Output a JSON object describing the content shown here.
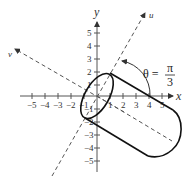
{
  "diagram": {
    "type": "coordinate-rotation-cylinder",
    "axes": {
      "x_label": "x",
      "y_label": "y",
      "u_label": "u",
      "v_label": "v",
      "x_ticks": [
        "−5",
        "−4",
        "−3",
        "−2",
        "−1",
        "1",
        "2",
        "3",
        "4",
        "5"
      ],
      "y_ticks": [
        "5",
        "4",
        "3",
        "2",
        "1",
        "−1",
        "−2",
        "−3",
        "−4",
        "−5"
      ]
    },
    "angle": {
      "theta_symbol": "θ =",
      "numerator": "π",
      "denominator": "3"
    },
    "colors": {
      "axis": "#555555",
      "curve": "#111111",
      "dashed": "#555555",
      "text": "#333333"
    }
  }
}
